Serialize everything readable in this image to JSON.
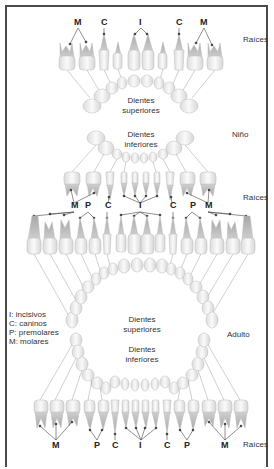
{
  "child": {
    "section_label": "Niño",
    "upper": {
      "roots_label": "Raíces",
      "arch_label_line1": "Dientes",
      "arch_label_line2": "superiores",
      "type_labels": [
        "M",
        "C",
        "I",
        "C",
        "M"
      ]
    },
    "lower": {
      "arch_label_line1": "Dientes",
      "arch_label_line2": "inferiores",
      "roots_label": "Raíces",
      "type_labels": [
        "M",
        "P",
        "C",
        "I",
        "C",
        "P",
        "M"
      ]
    }
  },
  "adult": {
    "section_label": "Adulto",
    "upper": {
      "type_labels": [
        "M",
        "P",
        "C",
        "I",
        "C",
        "P",
        "M"
      ],
      "arch_label_line1": "Dientes",
      "arch_label_line2": "superiores"
    },
    "lower": {
      "arch_label_line1": "Dientes",
      "arch_label_line2": "inferiores",
      "type_labels": [
        "M",
        "P",
        "C",
        "I",
        "C",
        "P",
        "M"
      ],
      "roots_label": "Raíces"
    }
  },
  "legend": {
    "items": [
      "I: incisivos",
      "C: caninos",
      "P: premolares",
      "M: molares"
    ]
  },
  "colors": {
    "frame": "#4a4a4a",
    "crown": "#f2f2f2",
    "root": "#b8b8b8",
    "line": "#777777"
  }
}
